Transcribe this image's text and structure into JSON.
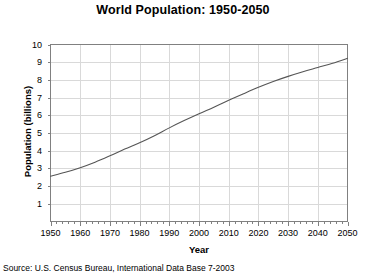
{
  "chart_data": {
    "type": "line",
    "title": "World Population: 1950-2050",
    "xlabel": "Year",
    "ylabel": "Population (billions)",
    "xlim": [
      1950,
      2050
    ],
    "ylim": [
      0,
      10
    ],
    "grid": true,
    "legend": null,
    "source_note": "Source: U.S. Census Bureau, International Data Base 7-2003",
    "x_ticks": [
      1950,
      1960,
      1970,
      1980,
      1990,
      2000,
      2010,
      2020,
      2030,
      2040,
      2050
    ],
    "x_tick_labels": [
      "1950",
      "1960",
      "1970",
      "1980",
      "1990",
      "2000",
      "2010",
      "2020",
      "2030",
      "2040",
      "2050"
    ],
    "x_minor_tick_interval": 2,
    "y_ticks": [
      1,
      2,
      3,
      4,
      5,
      6,
      7,
      8,
      9,
      10
    ],
    "y_tick_labels": [
      "1",
      "2",
      "3",
      "4",
      "5",
      "6",
      "7",
      "8",
      "9",
      "10"
    ],
    "series": [
      {
        "name": "World Population",
        "color": "#555555",
        "x": [
          1950,
          1955,
          1960,
          1965,
          1970,
          1975,
          1980,
          1985,
          1990,
          1995,
          2000,
          2005,
          2010,
          2015,
          2020,
          2025,
          2030,
          2035,
          2040,
          2045,
          2050
        ],
        "values": [
          2.56,
          2.78,
          3.04,
          3.35,
          3.71,
          4.09,
          4.45,
          4.85,
          5.29,
          5.7,
          6.09,
          6.46,
          6.85,
          7.22,
          7.58,
          7.91,
          8.2,
          8.46,
          8.7,
          8.94,
          9.22
        ]
      }
    ]
  },
  "axis_colors": {
    "grid": "#d9d9d9",
    "frame": "#808080",
    "line": "#555555"
  }
}
